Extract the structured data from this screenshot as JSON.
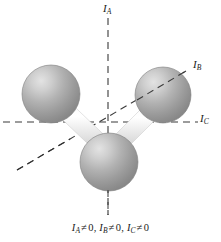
{
  "figure": {
    "type": "molecular-structure-diagram",
    "background_color": "#ffffff"
  },
  "axes": [
    {
      "id": "IA",
      "symbol": "I",
      "subscript": "A",
      "label": "IA",
      "orientation": "vertical",
      "style": "dashed",
      "color": "#3a3a3a",
      "x1": 108,
      "y1": 18,
      "x2": 108,
      "y2": 215
    },
    {
      "id": "IB",
      "symbol": "I",
      "subscript": "B",
      "label": "IB",
      "orientation": "diagonal",
      "style": "dashed",
      "color": "#3a3a3a",
      "x1": 17,
      "y1": 170,
      "x2": 186,
      "y2": 71
    },
    {
      "id": "IC",
      "symbol": "I",
      "subscript": "C",
      "label": "IC",
      "orientation": "horizontal",
      "style": "dashed",
      "color": "#3a3a3a",
      "x1": 3,
      "y1": 122,
      "x2": 198,
      "y2": 122
    }
  ],
  "atoms": [
    {
      "id": "atom-left",
      "cx": 51,
      "cy": 94,
      "r": 29,
      "color": "#9a9a9a",
      "highlight": "#d9d9d9"
    },
    {
      "id": "atom-right",
      "cx": 163,
      "cy": 95,
      "r": 28,
      "color": "#9a9a9a",
      "highlight": "#d9d9d9"
    },
    {
      "id": "atom-bottom",
      "cx": 109,
      "cy": 162,
      "r": 29,
      "color": "#9a9a9a",
      "highlight": "#d9d9d9"
    }
  ],
  "bonds": [
    {
      "id": "bond-left",
      "from": "atom-left",
      "to": "atom-bottom",
      "color": "#eeeeee"
    },
    {
      "id": "bond-right",
      "from": "atom-right",
      "to": "atom-bottom",
      "color": "#eeeeee"
    }
  ],
  "caption": {
    "full_text": "IA ≠ 0, IB ≠ 0, IC ≠ 0",
    "terms": [
      {
        "symbol": "I",
        "subscript": "A",
        "operator": "≠",
        "value": "0",
        "separator": ","
      },
      {
        "symbol": "I",
        "subscript": "B",
        "operator": "≠",
        "value": "0",
        "separator": ","
      },
      {
        "symbol": "I",
        "subscript": "C",
        "operator": "≠",
        "value": "0",
        "separator": ""
      }
    ]
  }
}
